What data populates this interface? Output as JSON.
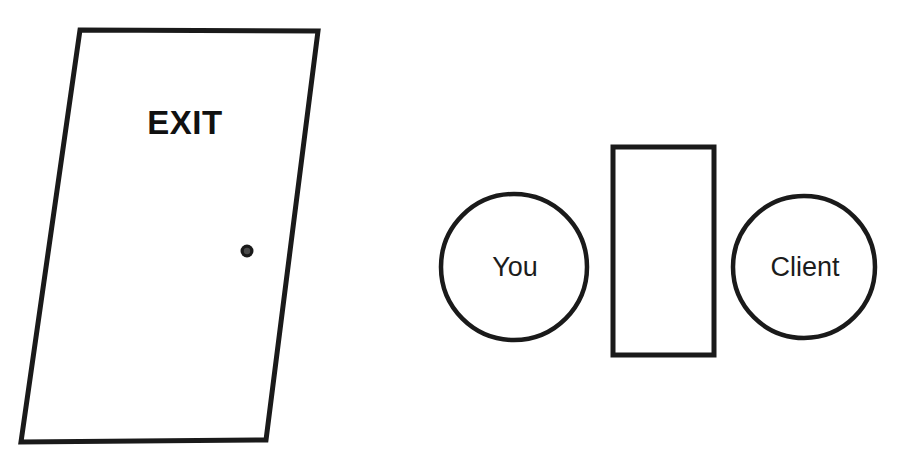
{
  "scene": {
    "title": "Exit door and seating position diagram",
    "background_color": "#ffffff",
    "stroke_color": "#1a1a1a",
    "width": 902,
    "height": 470
  },
  "door": {
    "label": "EXIT",
    "knob_label": "doorknob",
    "outline_color": "#1a1a1a",
    "fill_color": "#ffffff",
    "stroke_width": 5,
    "points": "80,30 318,31 266,440 21,442",
    "knob": {
      "cx": 247,
      "cy": 251,
      "r": 6.5,
      "inner_r": 3.2,
      "color": "#1a1a1a",
      "inner_color": "#4a4a4a"
    }
  },
  "seating": {
    "you": {
      "label": "You",
      "cx": 514,
      "cy": 267,
      "r": 73,
      "stroke": "#1a1a1a",
      "stroke_width": 4.5,
      "fill": "#ffffff"
    },
    "table": {
      "label": "table",
      "x": 613,
      "y": 147,
      "width": 101,
      "height": 208,
      "stroke": "#1a1a1a",
      "stroke_width": 5,
      "fill": "#ffffff"
    },
    "client": {
      "label": "Client",
      "cx": 804,
      "cy": 267,
      "r": 71,
      "stroke": "#1a1a1a",
      "stroke_width": 4.5,
      "fill": "#ffffff"
    }
  }
}
